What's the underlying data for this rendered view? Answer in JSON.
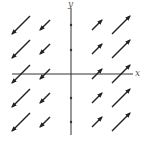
{
  "diagram": {
    "type": "vector-field",
    "axes": {
      "x_label": "x",
      "y_label": "y",
      "origin_px": [
        71,
        74
      ],
      "x_range_px": [
        12,
        133
      ],
      "y_range_px": [
        8,
        135
      ],
      "x_ticks_px": [
        20,
        45,
        97,
        122
      ],
      "y_ticks_px": [
        25,
        50,
        98,
        122
      ],
      "color": "#333333"
    },
    "arrow_color": "#222222",
    "arrows": [
      {
        "row": 0,
        "col": 0,
        "dir": "down-left",
        "size": "long"
      },
      {
        "row": 0,
        "col": 1,
        "dir": "down-left",
        "size": "short"
      },
      {
        "row": 0,
        "col": 2,
        "dir": "up-right",
        "size": "short"
      },
      {
        "row": 0,
        "col": 3,
        "dir": "up-right",
        "size": "long"
      },
      {
        "row": 1,
        "col": 0,
        "dir": "down-left",
        "size": "long"
      },
      {
        "row": 1,
        "col": 1,
        "dir": "down-left",
        "size": "short"
      },
      {
        "row": 1,
        "col": 2,
        "dir": "up-right",
        "size": "short"
      },
      {
        "row": 1,
        "col": 3,
        "dir": "up-right",
        "size": "long"
      },
      {
        "row": 2,
        "col": 0,
        "dir": "down-left",
        "size": "long"
      },
      {
        "row": 2,
        "col": 1,
        "dir": "down-left",
        "size": "short"
      },
      {
        "row": 2,
        "col": 2,
        "dir": "up-right",
        "size": "short"
      },
      {
        "row": 2,
        "col": 3,
        "dir": "up-right",
        "size": "long"
      },
      {
        "row": 3,
        "col": 0,
        "dir": "down-left",
        "size": "long"
      },
      {
        "row": 3,
        "col": 1,
        "dir": "down-left",
        "size": "short"
      },
      {
        "row": 3,
        "col": 2,
        "dir": "up-right",
        "size": "short"
      },
      {
        "row": 3,
        "col": 3,
        "dir": "up-right",
        "size": "long"
      },
      {
        "row": 4,
        "col": 0,
        "dir": "down-left",
        "size": "long"
      },
      {
        "row": 4,
        "col": 1,
        "dir": "down-left",
        "size": "short"
      },
      {
        "row": 4,
        "col": 2,
        "dir": "up-right",
        "size": "short"
      },
      {
        "row": 4,
        "col": 3,
        "dir": "up-right",
        "size": "long"
      }
    ],
    "grid": {
      "col_centers_px": [
        21,
        45,
        97,
        121
      ],
      "row_centers_px": [
        25,
        49,
        74,
        98,
        122
      ],
      "long_half_px": 9,
      "short_half_px": 5
    }
  }
}
